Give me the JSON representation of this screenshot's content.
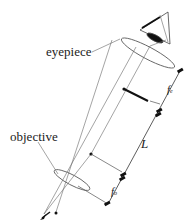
{
  "diagram": {
    "labels": {
      "eyepiece": "eyepiece",
      "objective": "objective",
      "tube_length": "L",
      "eyepiece_focal": "f",
      "eyepiece_focal_sub": "e",
      "objective_focal": "f",
      "objective_focal_sub": "o"
    },
    "elements": [
      "eye",
      "eyepiece-lens",
      "objective-lens",
      "intermediate-image-arrow",
      "object-arrow",
      "focal-points",
      "dimension-lines"
    ],
    "colors": {
      "line": "#555555",
      "ink": "#111111",
      "background": "#ffffff"
    }
  }
}
